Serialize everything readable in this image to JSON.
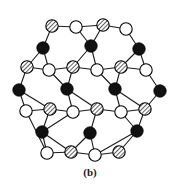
{
  "figure": {
    "caption": "(b)",
    "background_color": "#ffffff",
    "edge_color": "#1a1a1a",
    "edge_width": 1.1
  },
  "legend": {
    "node_types": [
      {
        "key": "filled",
        "label": "filled black atom",
        "fill": "#111111",
        "stroke": "#000000"
      },
      {
        "key": "hatched",
        "label": "hatched grey atom",
        "fill": "#b0b0b0",
        "stroke": "#000000"
      },
      {
        "key": "open",
        "label": "open white atom",
        "fill": "#ffffff",
        "stroke": "#000000"
      }
    ]
  },
  "chart_data": {
    "type": "scatter",
    "title": "(b)",
    "xlabel": "",
    "ylabel": "",
    "xlim": [
      0,
      180
    ],
    "ylim": [
      0,
      170
    ],
    "grid": false,
    "legend_position": "none",
    "node_radius": {
      "filled": 6.2,
      "hatched": 6.2,
      "open": 6.2
    },
    "nodes": [
      {
        "id": 0,
        "x": 52,
        "y": 26,
        "type": "hatched"
      },
      {
        "id": 1,
        "x": 76,
        "y": 27,
        "type": "open"
      },
      {
        "id": 2,
        "x": 103,
        "y": 25,
        "type": "hatched"
      },
      {
        "id": 3,
        "x": 126,
        "y": 29,
        "type": "open"
      },
      {
        "id": 4,
        "x": 43,
        "y": 48,
        "type": "filled"
      },
      {
        "id": 5,
        "x": 91,
        "y": 46,
        "type": "filled"
      },
      {
        "id": 6,
        "x": 139,
        "y": 49,
        "type": "filled"
      },
      {
        "id": 7,
        "x": 27,
        "y": 67,
        "type": "hatched"
      },
      {
        "id": 8,
        "x": 49,
        "y": 70,
        "type": "open"
      },
      {
        "id": 9,
        "x": 73,
        "y": 67,
        "type": "hatched"
      },
      {
        "id": 10,
        "x": 97,
        "y": 70,
        "type": "open"
      },
      {
        "id": 11,
        "x": 121,
        "y": 67,
        "type": "hatched"
      },
      {
        "id": 12,
        "x": 146,
        "y": 70,
        "type": "open"
      },
      {
        "id": 13,
        "x": 19,
        "y": 90,
        "type": "filled"
      },
      {
        "id": 14,
        "x": 67,
        "y": 89,
        "type": "filled"
      },
      {
        "id": 15,
        "x": 115,
        "y": 89,
        "type": "filled"
      },
      {
        "id": 16,
        "x": 160,
        "y": 91,
        "type": "filled"
      },
      {
        "id": 17,
        "x": 26,
        "y": 111,
        "type": "open"
      },
      {
        "id": 18,
        "x": 50,
        "y": 109,
        "type": "hatched"
      },
      {
        "id": 19,
        "x": 73,
        "y": 112,
        "type": "open"
      },
      {
        "id": 20,
        "x": 97,
        "y": 109,
        "type": "hatched"
      },
      {
        "id": 21,
        "x": 121,
        "y": 112,
        "type": "open"
      },
      {
        "id": 22,
        "x": 145,
        "y": 109,
        "type": "hatched"
      },
      {
        "id": 23,
        "x": 42,
        "y": 132,
        "type": "filled"
      },
      {
        "id": 24,
        "x": 90,
        "y": 133,
        "type": "filled"
      },
      {
        "id": 25,
        "x": 137,
        "y": 131,
        "type": "filled"
      },
      {
        "id": 26,
        "x": 47,
        "y": 153,
        "type": "open"
      },
      {
        "id": 27,
        "x": 71,
        "y": 152,
        "type": "hatched"
      },
      {
        "id": 28,
        "x": 95,
        "y": 155,
        "type": "open"
      },
      {
        "id": 29,
        "x": 119,
        "y": 152,
        "type": "hatched"
      }
    ],
    "edges": [
      [
        0,
        1
      ],
      [
        1,
        2
      ],
      [
        2,
        3
      ],
      [
        0,
        4
      ],
      [
        1,
        5
      ],
      [
        2,
        5
      ],
      [
        3,
        6
      ],
      [
        4,
        7
      ],
      [
        4,
        8
      ],
      [
        7,
        8
      ],
      [
        5,
        9
      ],
      [
        5,
        10
      ],
      [
        9,
        10
      ],
      [
        6,
        11
      ],
      [
        6,
        12
      ],
      [
        11,
        12
      ],
      [
        8,
        9
      ],
      [
        10,
        11
      ],
      [
        7,
        13
      ],
      [
        9,
        14
      ],
      [
        11,
        15
      ],
      [
        12,
        16
      ],
      [
        8,
        14
      ],
      [
        10,
        15
      ],
      [
        13,
        17
      ],
      [
        13,
        18
      ],
      [
        17,
        18
      ],
      [
        14,
        19
      ],
      [
        14,
        20
      ],
      [
        19,
        20
      ],
      [
        15,
        21
      ],
      [
        15,
        22
      ],
      [
        21,
        22
      ],
      [
        16,
        22
      ],
      [
        18,
        19
      ],
      [
        20,
        21
      ],
      [
        17,
        26
      ],
      [
        18,
        23
      ],
      [
        20,
        24
      ],
      [
        22,
        25
      ],
      [
        19,
        23
      ],
      [
        21,
        25
      ],
      [
        23,
        26
      ],
      [
        23,
        27
      ],
      [
        26,
        27
      ],
      [
        24,
        27
      ],
      [
        24,
        28
      ],
      [
        27,
        28
      ],
      [
        25,
        28
      ],
      [
        25,
        29
      ],
      [
        28,
        29
      ]
    ]
  }
}
